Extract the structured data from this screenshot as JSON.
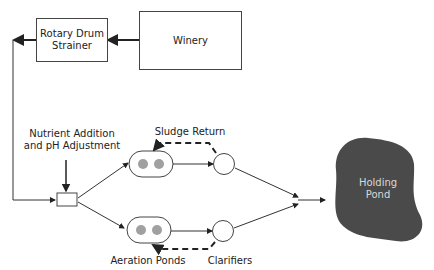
{
  "diagram": {
    "nodes": {
      "winery": "Winery",
      "strainer_line1": "Rotary Drum",
      "strainer_line2": "Strainer",
      "nutrient_line1": "Nutrient Addition",
      "nutrient_line2": "and pH Adjustment",
      "sludge_return": "Sludge Return",
      "aeration_ponds": "Aeration Ponds",
      "clarifiers": "Clarifiers",
      "holding_pond_line1": "Holding",
      "holding_pond_line2": "Pond"
    },
    "colors": {
      "line": "#333333",
      "aerator": "#a0a0a0",
      "pond": "#4a4a4a",
      "pond_text": "#d8d8d8"
    }
  }
}
